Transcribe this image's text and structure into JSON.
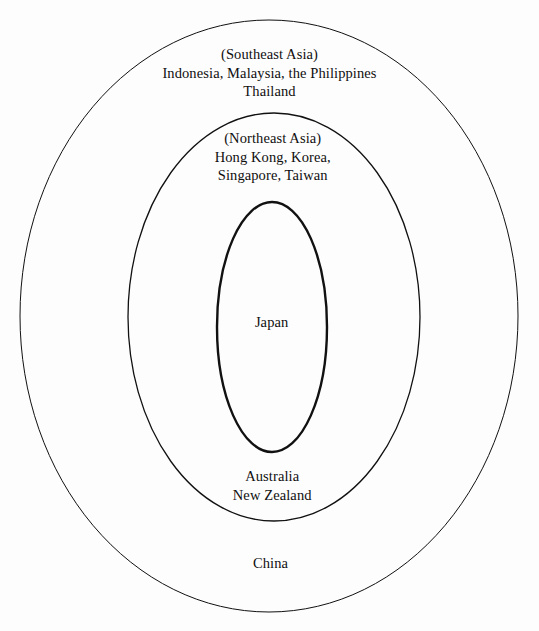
{
  "diagram": {
    "type": "concentric-ellipses",
    "background_color": "#fdfdfd",
    "stroke_color": "#111111",
    "rings": [
      {
        "id": "outer",
        "name": "outer-ellipse",
        "stroke_width": 1,
        "center": {
          "x": 269,
          "y": 316
        },
        "radius": {
          "x": 249,
          "y": 296
        }
      },
      {
        "id": "middle",
        "name": "middle-ellipse",
        "stroke_width": 1.3,
        "center": {
          "x": 274,
          "y": 317
        },
        "radius": {
          "x": 146,
          "y": 204
        }
      },
      {
        "id": "inner",
        "name": "inner-ellipse",
        "stroke_width": 2.4,
        "center": {
          "x": 272,
          "y": 327
        },
        "radius": {
          "x": 55,
          "y": 125
        }
      }
    ],
    "labels": {
      "outer_top": "(Southeast Asia)\nIndonesia, Malaysia, the Philippines\nThailand",
      "middle_top": "(Northeast Asia)\nHong Kong, Korea,\nSingapore, Taiwan",
      "inner": "Japan",
      "middle_bottom": "Australia\nNew Zealand",
      "outer_bottom": "China"
    }
  }
}
